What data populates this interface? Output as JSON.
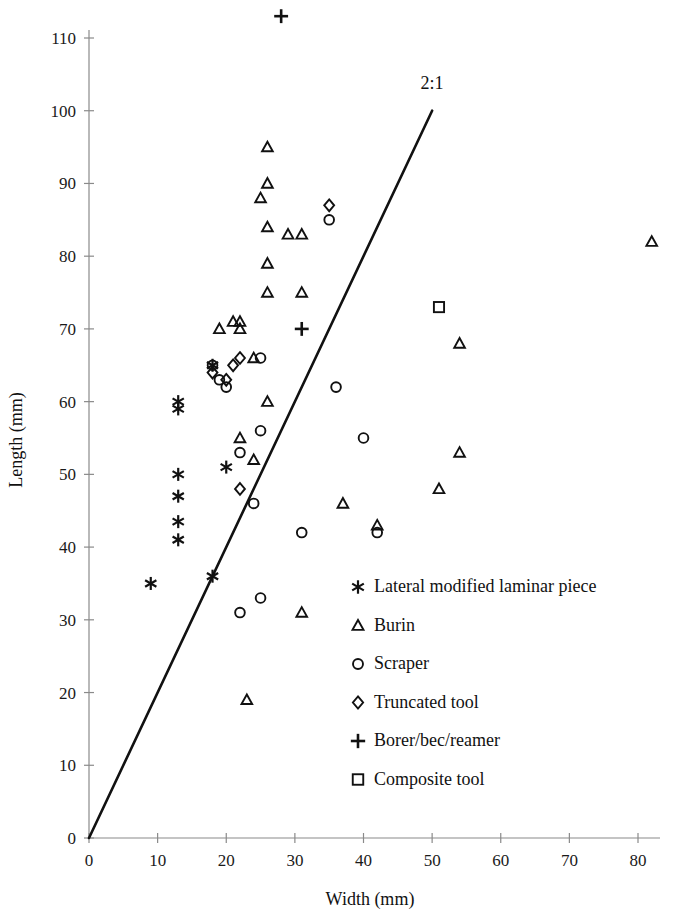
{
  "chart_data": {
    "type": "scatter",
    "title": "",
    "xlabel": "Width (mm)",
    "ylabel": "Length (mm)",
    "xlim": [
      0,
      80
    ],
    "ylim": [
      0,
      110
    ],
    "xticks": [
      0,
      10,
      20,
      30,
      40,
      50,
      60,
      70,
      80
    ],
    "yticks": [
      0,
      10,
      20,
      30,
      40,
      50,
      60,
      70,
      80,
      90,
      100,
      110
    ],
    "grid": false,
    "legend_position": "inside-lower-right",
    "annotations": [
      {
        "text": "2:1",
        "x": 50,
        "y": 103,
        "describes": "reference line of slope 2 (length = 2 x width)"
      }
    ],
    "reference_line": {
      "label": "2:1",
      "slope": 2,
      "intercept": 0,
      "x_start": 0,
      "y_start": 0,
      "x_end": 50,
      "y_end": 100,
      "color": "#111111"
    },
    "series": [
      {
        "name": "Lateral modified laminar piece",
        "marker": "asterisk",
        "color": "#111111",
        "points": [
          [
            9,
            35
          ],
          [
            13,
            60
          ],
          [
            13,
            59
          ],
          [
            13,
            50
          ],
          [
            13,
            47
          ],
          [
            13,
            43.5
          ],
          [
            13,
            41
          ],
          [
            18,
            65
          ],
          [
            18,
            36
          ],
          [
            20,
            51
          ]
        ]
      },
      {
        "name": "Burin",
        "marker": "triangle",
        "color": "#111111",
        "points": [
          [
            19,
            70
          ],
          [
            21,
            71
          ],
          [
            22,
            71
          ],
          [
            22,
            70
          ],
          [
            22,
            55
          ],
          [
            24,
            66
          ],
          [
            23,
            19
          ],
          [
            26,
            95
          ],
          [
            26,
            90
          ],
          [
            25,
            88
          ],
          [
            26,
            84
          ],
          [
            26,
            79
          ],
          [
            26,
            75
          ],
          [
            26,
            60
          ],
          [
            24,
            52
          ],
          [
            29,
            83
          ],
          [
            31,
            83
          ],
          [
            31,
            75
          ],
          [
            31,
            31
          ],
          [
            37,
            46
          ],
          [
            42,
            43
          ],
          [
            51,
            48
          ],
          [
            54,
            68
          ],
          [
            54,
            53
          ],
          [
            82,
            82
          ]
        ]
      },
      {
        "name": "Scraper",
        "marker": "circle",
        "color": "#111111",
        "points": [
          [
            18,
            65
          ],
          [
            19,
            63
          ],
          [
            20,
            62
          ],
          [
            22,
            53
          ],
          [
            25,
            66
          ],
          [
            25,
            56
          ],
          [
            24,
            46
          ],
          [
            22,
            31
          ],
          [
            25,
            33
          ],
          [
            31,
            42
          ],
          [
            35,
            85
          ],
          [
            36,
            62
          ],
          [
            40,
            55
          ],
          [
            42,
            42
          ]
        ]
      },
      {
        "name": "Truncated tool",
        "marker": "diamond",
        "color": "#111111",
        "points": [
          [
            18,
            64
          ],
          [
            20,
            63
          ],
          [
            21,
            65
          ],
          [
            22,
            66
          ],
          [
            22,
            48
          ],
          [
            35,
            87
          ]
        ]
      },
      {
        "name": "Borer/bec/reamer",
        "marker": "plus",
        "color": "#111111",
        "points": [
          [
            28,
            113
          ],
          [
            31,
            70
          ]
        ]
      },
      {
        "name": "Composite tool",
        "marker": "square",
        "color": "#111111",
        "points": [
          [
            51,
            73
          ]
        ]
      }
    ]
  },
  "legend": {
    "entries": [
      {
        "marker": "asterisk",
        "label": "Lateral modified laminar piece"
      },
      {
        "marker": "triangle",
        "label": "Burin"
      },
      {
        "marker": "circle",
        "label": "Scraper"
      },
      {
        "marker": "diamond",
        "label": "Truncated tool"
      },
      {
        "marker": "plus",
        "label": "Borer/bec/reamer"
      },
      {
        "marker": "square",
        "label": "Composite tool"
      }
    ]
  }
}
